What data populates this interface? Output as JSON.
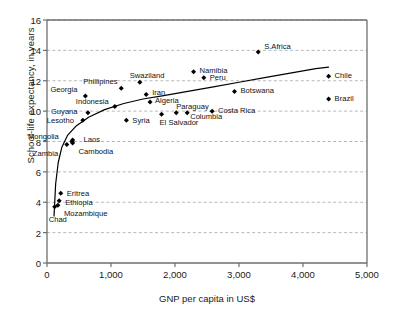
{
  "chart_data": {
    "type": "scatter",
    "title": "",
    "xlabel": "GNP per capita in US$",
    "ylabel": "School-life expectancy, in years",
    "xlim": [
      0,
      5000
    ],
    "ylim": [
      0,
      16
    ],
    "xticks": [
      "0",
      "1,000",
      "2,000",
      "3,000",
      "4,000",
      "5,000"
    ],
    "xtick_values": [
      0,
      1000,
      2000,
      3000,
      4000,
      5000
    ],
    "yticks": [
      "0",
      "2",
      "4",
      "6",
      "8",
      "10",
      "12",
      "14",
      "16"
    ],
    "ytick_values": [
      0,
      2,
      4,
      6,
      8,
      10,
      12,
      14,
      16
    ],
    "grid": "horizontal-dashed",
    "legend": "none",
    "marker": "diamond",
    "marker_color": "#000000",
    "trend_line": {
      "label": "logarithmic fit curve",
      "color": "#000000",
      "points": [
        [
          110,
          3.1
        ],
        [
          135,
          5.2
        ],
        [
          175,
          6.6
        ],
        [
          230,
          7.6
        ],
        [
          320,
          8.4
        ],
        [
          450,
          9.0
        ],
        [
          650,
          9.6
        ],
        [
          900,
          10.1
        ],
        [
          1200,
          10.5
        ],
        [
          1500,
          10.8
        ],
        [
          1800,
          11.0
        ],
        [
          2200,
          11.3
        ],
        [
          2600,
          11.6
        ],
        [
          3000,
          11.9
        ],
        [
          3400,
          12.2
        ],
        [
          3800,
          12.5
        ],
        [
          4200,
          12.8
        ],
        [
          4400,
          12.9
        ]
      ]
    },
    "points": [
      {
        "name": "Chad",
        "x": 120,
        "y": 3.7,
        "label_dx": -6,
        "label_dy": 13,
        "label_align": "left"
      },
      {
        "name": "Mozambique",
        "x": 170,
        "y": 3.8,
        "label_dx": 6,
        "label_dy": 9,
        "label_align": "left"
      },
      {
        "name": "Ethiopia",
        "x": 190,
        "y": 4.1,
        "label_dx": 6,
        "label_dy": 2,
        "label_align": "left"
      },
      {
        "name": "Eritrea",
        "x": 215,
        "y": 4.6,
        "label_dx": 6,
        "label_dy": 1,
        "label_align": "left"
      },
      {
        "name": "Zambia",
        "x": 310,
        "y": 7.8,
        "label_dx": -34,
        "label_dy": 9,
        "label_align": "left"
      },
      {
        "name": "Cambodia",
        "x": 400,
        "y": 7.9,
        "label_dx": 6,
        "label_dy": 9,
        "label_align": "left"
      },
      {
        "name": "Laos",
        "x": 400,
        "y": 8.1,
        "label_dx": 11,
        "label_dy": 0,
        "label_align": "left"
      },
      {
        "name": "Mongolia",
        "x": 390,
        "y": 8.0,
        "label_dx": -44,
        "label_dy": -5,
        "label_align": "left"
      },
      {
        "name": "Lesotho",
        "x": 560,
        "y": 9.4,
        "label_dx": -36,
        "label_dy": 1,
        "label_align": "left"
      },
      {
        "name": "Guyana",
        "x": 640,
        "y": 9.9,
        "label_dx": -37,
        "label_dy": -1,
        "label_align": "left"
      },
      {
        "name": "Georgia",
        "x": 600,
        "y": 11.0,
        "label_dx": -35,
        "label_dy": -6,
        "label_align": "left"
      },
      {
        "name": "Indonesia",
        "x": 1060,
        "y": 10.3,
        "label_dx": -39,
        "label_dy": -5,
        "label_align": "left"
      },
      {
        "name": "Syria",
        "x": 1240,
        "y": 9.4,
        "label_dx": 6,
        "label_dy": 1,
        "label_align": "left"
      },
      {
        "name": "Phillipines",
        "x": 1160,
        "y": 11.5,
        "label_dx": -38,
        "label_dy": -6,
        "label_align": "left"
      },
      {
        "name": "Swaziland",
        "x": 1450,
        "y": 11.9,
        "label_dx": -10,
        "label_dy": -6,
        "label_align": "left"
      },
      {
        "name": "Iran",
        "x": 1550,
        "y": 11.1,
        "label_dx": 6,
        "label_dy": -1,
        "label_align": "left"
      },
      {
        "name": "Algeria",
        "x": 1610,
        "y": 10.6,
        "label_dx": 5,
        "label_dy": -1,
        "label_align": "left"
      },
      {
        "name": "El Salvador",
        "x": 1790,
        "y": 9.8,
        "label_dx": -2,
        "label_dy": 9,
        "label_align": "left"
      },
      {
        "name": "Paraguay",
        "x": 2020,
        "y": 9.9,
        "label_dx": 0,
        "label_dy": -6,
        "label_align": "left"
      },
      {
        "name": "Columbia",
        "x": 2190,
        "y": 9.9,
        "label_dx": 3,
        "label_dy": 4,
        "label_align": "left"
      },
      {
        "name": "Costa Rica",
        "x": 2580,
        "y": 10.0,
        "label_dx": 6,
        "label_dy": 0,
        "label_align": "left"
      },
      {
        "name": "Namibia",
        "x": 2290,
        "y": 12.6,
        "label_dx": 6,
        "label_dy": -1,
        "label_align": "left"
      },
      {
        "name": "Peru",
        "x": 2450,
        "y": 12.2,
        "label_dx": 6,
        "label_dy": 0,
        "label_align": "left"
      },
      {
        "name": "Botswana",
        "x": 2930,
        "y": 11.3,
        "label_dx": 6,
        "label_dy": 0,
        "label_align": "left"
      },
      {
        "name": "S.Africa",
        "x": 3300,
        "y": 13.9,
        "label_dx": 6,
        "label_dy": -5,
        "label_align": "left"
      },
      {
        "name": "Chile",
        "x": 4400,
        "y": 12.3,
        "label_dx": 6,
        "label_dy": 0,
        "label_align": "left"
      },
      {
        "name": "Brazil",
        "x": 4400,
        "y": 10.8,
        "label_dx": 6,
        "label_dy": 0,
        "label_align": "left"
      }
    ]
  },
  "axis_style": {
    "frame_color": "#6e6e6e",
    "grid_color": "#999999",
    "text_color": "#1a1a1a"
  }
}
